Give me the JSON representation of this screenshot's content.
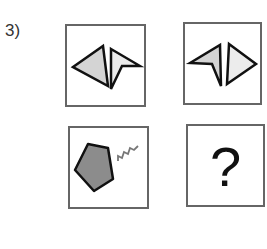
{
  "question": {
    "number": "3)",
    "cells": [
      {
        "id": "top-left",
        "content": "two triangles: gray filled triangle pointing left, light arrowhead pointing right"
      },
      {
        "id": "top-right",
        "content": "two triangles: light arrowhead pointing left, light triangle pointing right"
      },
      {
        "id": "bottom-left",
        "content": "gray pentagon with zigzag line"
      },
      {
        "id": "bottom-right",
        "content": "?"
      }
    ],
    "colors": {
      "border": "#666666",
      "fill_dark": "#8c8c8c",
      "fill_light": "#d4d4d4",
      "fill_lighter": "#ececec",
      "stroke": "#111111"
    }
  }
}
